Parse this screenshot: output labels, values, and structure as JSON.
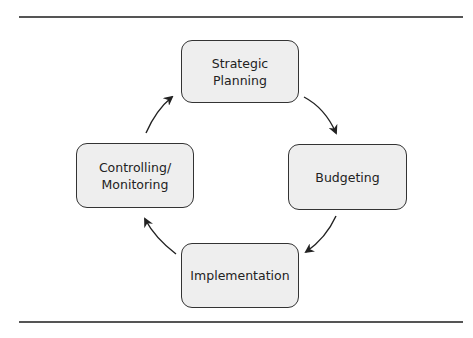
{
  "diagram": {
    "type": "cycle",
    "nodes": [
      {
        "id": "strategic-planning",
        "label": "Strategic\nPlanning",
        "line1": "Strategic",
        "line2": "Planning"
      },
      {
        "id": "budgeting",
        "label": "Budgeting"
      },
      {
        "id": "implementation",
        "label": "Implementation"
      },
      {
        "id": "controlling-monitoring",
        "label": "Controlling/\nMonitoring",
        "line1": "Controlling/",
        "line2": "Monitoring"
      }
    ],
    "edges": [
      {
        "from": "strategic-planning",
        "to": "budgeting"
      },
      {
        "from": "budgeting",
        "to": "implementation"
      },
      {
        "from": "implementation",
        "to": "controlling-monitoring"
      },
      {
        "from": "controlling-monitoring",
        "to": "strategic-planning"
      }
    ],
    "colors": {
      "box_fill": "#eeeeee",
      "box_border": "#333333",
      "arrow": "#222222",
      "rule": "#555555"
    }
  }
}
